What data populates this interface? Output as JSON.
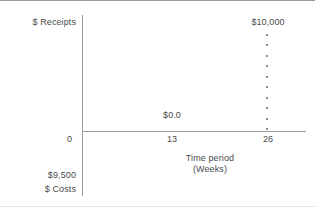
{
  "chart_data": {
    "type": "scatter",
    "title": "",
    "xlabel": "Time period\n(Weeks)",
    "ylabel_top": "$ Receipts",
    "ylabel_bottom": "$ Costs",
    "x": [
      0,
      13,
      26
    ],
    "xtick_labels": [
      "0",
      "13",
      "26"
    ],
    "xlim": [
      0,
      29
    ],
    "grid": false,
    "legend": "none",
    "annotations": [
      {
        "text": "$10,000",
        "x": 26,
        "position": "top-right"
      },
      {
        "text": "$0.0",
        "x": 13,
        "position": "above-axis-midpoint"
      },
      {
        "text": "$9,500",
        "position": "below-origin-left"
      }
    ],
    "series": [
      {
        "name": "Receipts at week 26",
        "style": "dotted-vertical",
        "x": 26,
        "value_label": "$10,000",
        "dot_count": 10
      },
      {
        "name": "Receipts at week 13",
        "style": "point-label",
        "x": 13,
        "value_label": "$0.0"
      }
    ],
    "cost_value_label": "$9,500"
  },
  "axes": {
    "y_title": "$ Receipts",
    "y_cost_value": "$9,500",
    "y_cost_title": "$ Costs",
    "x_title_line1": "Time period",
    "x_title_line2": "(Weeks)",
    "ticks": {
      "origin": "0",
      "mid": "13",
      "end": "26"
    },
    "axis_color": "#9b9b9b"
  },
  "labels": {
    "receipts_max": "$10,000",
    "receipts_zero": "$0.0"
  },
  "colors": {
    "background": "#ffffff",
    "text": "#4a4a4a",
    "axis": "#9b9b9b",
    "dots": "#8c8c8c"
  }
}
